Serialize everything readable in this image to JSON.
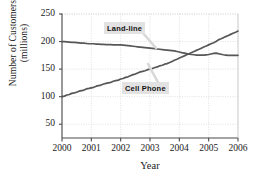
{
  "chart_data": {
    "type": "line",
    "title": "",
    "xlabel": "Year",
    "ylabel_line1": "Number of Customers",
    "ylabel_line2": "(millions)",
    "xlim": [
      2000,
      2006
    ],
    "ylim": [
      25,
      250
    ],
    "xticks": [
      "2000",
      "2001",
      "2002",
      "2003",
      "2004",
      "2005",
      "2006"
    ],
    "yticks": [
      "50",
      "100",
      "150",
      "200",
      "250"
    ],
    "ytick_values": [
      50,
      100,
      150,
      200,
      250
    ],
    "xtick_values": [
      2000,
      2001,
      2002,
      2003,
      2004,
      2005,
      2006
    ],
    "grid": true,
    "grid_color": "#cccccc",
    "line_color": "#575757",
    "axis_color": "#4a4a4a",
    "legend_position": "inline-annotations",
    "annotations": [
      {
        "label": "Land-line",
        "x_pct": 37,
        "y_pct": 13
      },
      {
        "label": "Cell Phone",
        "x_pct": 50,
        "y_pct": 64
      }
    ],
    "series": [
      {
        "name": "Land-line",
        "color": "#575757",
        "x": [
          2000,
          2000.08,
          2000.17,
          2000.25,
          2000.33,
          2000.42,
          2000.5,
          2000.58,
          2000.67,
          2000.75,
          2000.83,
          2000.92,
          2001,
          2001.08,
          2001.17,
          2001.25,
          2001.33,
          2001.42,
          2001.5,
          2001.58,
          2001.67,
          2001.75,
          2001.83,
          2001.92,
          2002,
          2002.08,
          2002.17,
          2002.25,
          2002.33,
          2002.42,
          2002.5,
          2002.58,
          2002.67,
          2002.75,
          2002.83,
          2002.92,
          2003,
          2003.08,
          2003.17,
          2003.25,
          2003.33,
          2003.42,
          2003.5,
          2003.58,
          2003.67,
          2003.75,
          2003.83,
          2003.92,
          2004,
          2004.08,
          2004.17,
          2004.25,
          2004.33,
          2004.42,
          2004.5,
          2004.58,
          2004.67,
          2004.75,
          2004.83,
          2004.92,
          2005,
          2005.08,
          2005.17,
          2005.25,
          2005.33,
          2005.42,
          2005.5,
          2005.58,
          2005.67,
          2005.75,
          2005.83,
          2005.92,
          2006
        ],
        "y": [
          200,
          200,
          199.5,
          199,
          198.5,
          198.5,
          198,
          197.5,
          197,
          197,
          196.5,
          196,
          196,
          196,
          195.5,
          195.5,
          195,
          195,
          194.5,
          194.5,
          194.5,
          194,
          194,
          194,
          194,
          193.5,
          193,
          192.5,
          192,
          191.5,
          191,
          190.5,
          190,
          189.5,
          189,
          188.5,
          188,
          187.5,
          187,
          186.5,
          186,
          185.5,
          185,
          184.5,
          184,
          183.5,
          183,
          182,
          181,
          180,
          179,
          178,
          177,
          176.5,
          176,
          175.5,
          175.5,
          175.5,
          175.5,
          176,
          176.5,
          177.5,
          178.5,
          179,
          178,
          177,
          176,
          175.5,
          175,
          175,
          175,
          175,
          175
        ]
      },
      {
        "name": "Cell Phone",
        "color": "#575757",
        "x": [
          2000,
          2000.08,
          2000.17,
          2000.25,
          2000.33,
          2000.42,
          2000.5,
          2000.58,
          2000.67,
          2000.75,
          2000.83,
          2000.92,
          2001,
          2001.08,
          2001.17,
          2001.25,
          2001.33,
          2001.42,
          2001.5,
          2001.58,
          2001.67,
          2001.75,
          2001.83,
          2001.92,
          2002,
          2002.08,
          2002.17,
          2002.25,
          2002.33,
          2002.42,
          2002.5,
          2002.58,
          2002.67,
          2002.75,
          2002.83,
          2002.92,
          2003,
          2003.08,
          2003.17,
          2003.25,
          2003.33,
          2003.42,
          2003.5,
          2003.58,
          2003.67,
          2003.75,
          2003.83,
          2003.92,
          2004,
          2004.08,
          2004.17,
          2004.25,
          2004.33,
          2004.42,
          2004.5,
          2004.58,
          2004.67,
          2004.75,
          2004.83,
          2004.92,
          2005,
          2005.08,
          2005.17,
          2005.25,
          2005.33,
          2005.42,
          2005.5,
          2005.58,
          2005.67,
          2005.75,
          2005.83,
          2005.92,
          2006
        ],
        "y": [
          100,
          101,
          103,
          104,
          106,
          107,
          108,
          110,
          111,
          112,
          114,
          115,
          116,
          117,
          119,
          120,
          121,
          123,
          124,
          125,
          126,
          128,
          129,
          130,
          132,
          133,
          135,
          136,
          138,
          140,
          141,
          143,
          145,
          146,
          147,
          149,
          150,
          151,
          153,
          154,
          156,
          157,
          159,
          160,
          162,
          164,
          166,
          168,
          170,
          172,
          174,
          176,
          178,
          180,
          182,
          184,
          186,
          188,
          190,
          192,
          194,
          196,
          198,
          200,
          203,
          205,
          207,
          209,
          211,
          213,
          215,
          217,
          219
        ]
      }
    ]
  }
}
